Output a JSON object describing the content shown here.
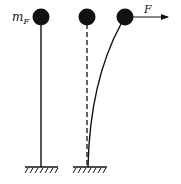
{
  "labels": {
    "mass": "m",
    "mass_subscript": "F",
    "force": "F"
  },
  "colors": {
    "ink": "#111111",
    "background": "#ffffff"
  },
  "panels": [
    {
      "name": "upright-pendulum",
      "rod": "solid-straight"
    },
    {
      "name": "reference-position",
      "rod": "dashed-straight"
    },
    {
      "name": "deflected-under-force",
      "rod": "solid-curved",
      "force_arrow": true
    }
  ]
}
